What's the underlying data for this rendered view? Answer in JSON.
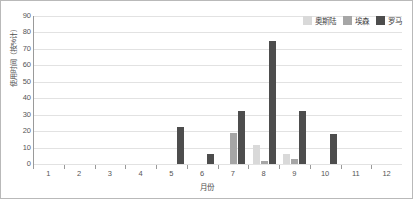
{
  "chart_data": {
    "type": "bar",
    "title": "",
    "xlabel": "月份",
    "ylabel": "使用时间（按%计）",
    "ylim": [
      0,
      90
    ],
    "yticks": [
      0,
      10,
      20,
      30,
      40,
      50,
      60,
      70,
      80,
      90
    ],
    "grid": "horizontal",
    "legend_position": "top-right",
    "categories": [
      "1",
      "2",
      "3",
      "4",
      "5",
      "6",
      "7",
      "8",
      "9",
      "10",
      "11",
      "12"
    ],
    "series": [
      {
        "name": "奥斯陆",
        "color": "#d9d9d9",
        "values": [
          0,
          0,
          0,
          0,
          0,
          0,
          0,
          11.5,
          6,
          0,
          0,
          0
        ]
      },
      {
        "name": "埃森",
        "color": "#a6a6a6",
        "values": [
          0,
          0,
          0,
          0,
          0,
          0,
          19,
          2,
          3,
          0,
          0,
          0
        ]
      },
      {
        "name": "罗马",
        "color": "#4d4d4d",
        "values": [
          0,
          0,
          0,
          0,
          22.5,
          6,
          32,
          75,
          32.5,
          18,
          0,
          0
        ]
      }
    ]
  },
  "axes": {
    "y_title": "使用时间（按%计）",
    "x_title": "月份",
    "y_tick_labels": [
      "90",
      "80",
      "70",
      "60",
      "50",
      "40",
      "30",
      "20",
      "10",
      "0"
    ],
    "x_tick_labels": [
      "1",
      "2",
      "3",
      "4",
      "5",
      "6",
      "7",
      "8",
      "9",
      "10",
      "11",
      "12"
    ]
  },
  "legend": {
    "items": [
      {
        "label": "奥斯陆",
        "color": "#d9d9d9"
      },
      {
        "label": "埃森",
        "color": "#a6a6a6"
      },
      {
        "label": "罗马",
        "color": "#4d4d4d"
      }
    ]
  },
  "style": {
    "background": "#ffffff",
    "grid_color": "#e2e2e2",
    "axis_color": "#9a9a9a",
    "border_color": "#b9b9b9",
    "text_color": "#555555"
  }
}
